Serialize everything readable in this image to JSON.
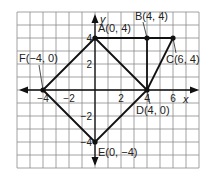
{
  "grid": {
    "x_min": -6,
    "x_max": 8,
    "y_min": -6,
    "y_max": 6,
    "origin_px": [
      95,
      90
    ],
    "unit_px": 13,
    "grid_color": "#8a8a8a",
    "line_color": "#111111"
  },
  "axes": {
    "x_label": "x",
    "y_label": "y",
    "x_ticks": [
      {
        "value": -4,
        "label": "−4"
      },
      {
        "value": -2,
        "label": "−2"
      },
      {
        "value": 2,
        "label": "2"
      },
      {
        "value": 4,
        "label": "4"
      },
      {
        "value": 6,
        "label": "6"
      }
    ],
    "y_ticks": [
      {
        "value": 4,
        "label": "4"
      },
      {
        "value": 2,
        "label": "2"
      },
      {
        "value": -2,
        "label": "−2"
      },
      {
        "value": -4,
        "label": "−4"
      }
    ]
  },
  "points": [
    {
      "name": "A",
      "x": 0,
      "y": 4,
      "label": "A(0, 4)"
    },
    {
      "name": "B",
      "x": 4,
      "y": 4,
      "label": "B(4, 4)"
    },
    {
      "name": "C",
      "x": 6,
      "y": 4,
      "label": "C(6, 4)"
    },
    {
      "name": "D",
      "x": 4,
      "y": 0,
      "label": "D(4, 0)"
    },
    {
      "name": "E",
      "x": 0,
      "y": -4,
      "label": "E(0, −4)"
    },
    {
      "name": "F",
      "x": -4,
      "y": 0,
      "label": "F(−4, 0)"
    }
  ],
  "segments": [
    [
      "A",
      "C"
    ],
    [
      "B",
      "D"
    ],
    [
      "C",
      "D"
    ],
    [
      "A",
      "D"
    ],
    [
      "D",
      "E"
    ],
    [
      "E",
      "F"
    ],
    [
      "F",
      "A"
    ]
  ],
  "chart_data": {
    "type": "scatter",
    "title": "",
    "xlabel": "x",
    "ylabel": "y",
    "xlim": [
      -6,
      8
    ],
    "ylim": [
      -6,
      6
    ],
    "grid": true,
    "points": [
      {
        "label": "A",
        "x": 0,
        "y": 4
      },
      {
        "label": "B",
        "x": 4,
        "y": 4
      },
      {
        "label": "C",
        "x": 6,
        "y": 4
      },
      {
        "label": "D",
        "x": 4,
        "y": 0
      },
      {
        "label": "E",
        "x": 0,
        "y": -4
      },
      {
        "label": "F",
        "x": -4,
        "y": 0
      }
    ],
    "polygons": [
      {
        "name": "square AFED",
        "vertices": [
          "A",
          "F",
          "E",
          "D"
        ]
      },
      {
        "name": "triangle BCD",
        "vertices": [
          "B",
          "C",
          "D"
        ]
      }
    ]
  }
}
